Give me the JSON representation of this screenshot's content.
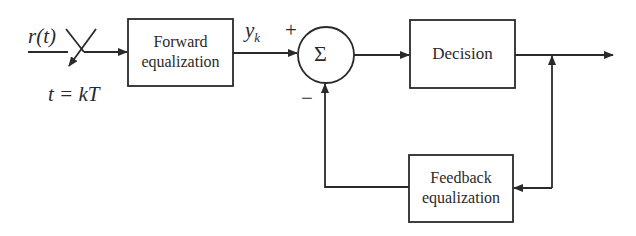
{
  "diagram": {
    "type": "block-diagram",
    "input": {
      "signal": "r(t)",
      "sampler_label": "t = kT"
    },
    "blocks": [
      {
        "id": "forward",
        "label_line1": "Forward",
        "label_line2": "equalization"
      },
      {
        "id": "decision",
        "label": "Decision"
      },
      {
        "id": "feedback",
        "label_line1": "Feedback",
        "label_line2": "equalization"
      }
    ],
    "summer": {
      "symbol": "Σ",
      "plus_sign": "+",
      "minus_sign": "−"
    },
    "signals": {
      "forward_output": "y",
      "forward_output_subscript": "k"
    },
    "connections": [
      {
        "from": "input r(t)",
        "to": "sampler switch"
      },
      {
        "from": "sampler switch",
        "to": "forward"
      },
      {
        "from": "forward",
        "to": "summer (+)",
        "label": "y_k"
      },
      {
        "from": "summer",
        "to": "decision"
      },
      {
        "from": "decision",
        "to": "output"
      },
      {
        "from": "decision output",
        "to": "feedback"
      },
      {
        "from": "feedback",
        "to": "summer (−)"
      }
    ],
    "colors": {
      "stroke": "#2a2a2a",
      "background": "#ffffff"
    }
  }
}
